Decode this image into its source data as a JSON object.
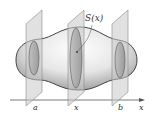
{
  "diagram": {
    "type": "solid-cross-sections",
    "labels": {
      "area_function": "S(x)",
      "left_bound": "a",
      "variable_point": "x",
      "right_bound": "b",
      "axis": "x"
    },
    "colors": {
      "plane_fill": "#c9c9c9",
      "plane_stroke": "#8a8a8a",
      "body_outline": "#333333",
      "section_fill": "#9a9a9a",
      "axis": "#555555"
    }
  }
}
